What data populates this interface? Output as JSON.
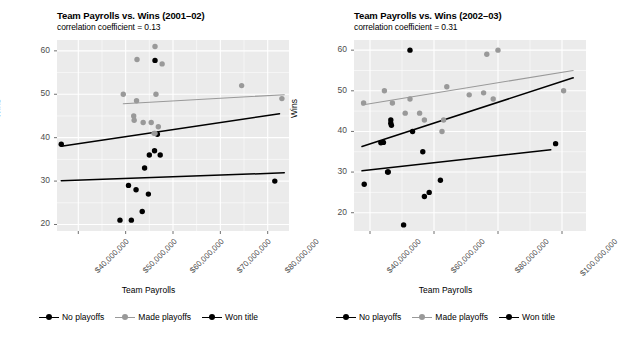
{
  "figure": {
    "background": "#ffffff",
    "panel_background": "#ebebeb",
    "grid_color": "#ffffff",
    "axis_text_color": "#4d4d4d"
  },
  "legend": {
    "items": [
      {
        "label": "No playoffs",
        "color": "#000000",
        "key": "point-line-key"
      },
      {
        "label": "Made playoffs",
        "color": "#999999",
        "key": "point-line-key"
      },
      {
        "label": "Won title",
        "color": "#000000",
        "key": "point-line-key"
      }
    ]
  },
  "chart_data": [
    {
      "type": "scatter",
      "panel": "left",
      "title": "Team Payrolls vs. Wins (2001–02)",
      "subtitle": "correlation coefficient = 0.13",
      "xlabel": "Team Payrolls",
      "ylabel": "Wins",
      "xlim": [
        35500000,
        84500000
      ],
      "ylim": [
        18.5,
        62.5
      ],
      "xticks": [
        40000000,
        50000000,
        60000000,
        70000000,
        80000000
      ],
      "xticklabels": [
        "$40,000,000",
        "$50,000,000",
        "$60,000,000",
        "$70,000,000",
        "$80,000,000"
      ],
      "yticks": [
        20,
        30,
        40,
        50,
        60
      ],
      "yticklabels": [
        "20",
        "30",
        "40",
        "50",
        "60"
      ],
      "grid": true,
      "legend_position": "bottom",
      "series": [
        {
          "name": "No playoffs",
          "color": "#000000",
          "points": [
            {
              "x": 36400000,
              "y": 38.5
            },
            {
              "x": 56700000,
              "y": 40.8
            },
            {
              "x": 55000000,
              "y": 36.0
            },
            {
              "x": 56100000,
              "y": 37.0
            },
            {
              "x": 57300000,
              "y": 36.0
            },
            {
              "x": 54000000,
              "y": 33.0
            },
            {
              "x": 81500000,
              "y": 30.0
            },
            {
              "x": 50600000,
              "y": 29.0
            },
            {
              "x": 52200000,
              "y": 28.0
            },
            {
              "x": 54800000,
              "y": 27.0
            },
            {
              "x": 53500000,
              "y": 23.0
            },
            {
              "x": 48800000,
              "y": 21.0
            },
            {
              "x": 51200000,
              "y": 21.0
            }
          ],
          "fit_line": {
            "x0": 36400000,
            "y0": 38.0,
            "x1": 82500000,
            "y1": 45.5
          }
        },
        {
          "name": "Made playoffs",
          "color": "#999999",
          "points": [
            {
              "x": 56200000,
              "y": 61.0
            },
            {
              "x": 52400000,
              "y": 58.0
            },
            {
              "x": 57700000,
              "y": 57.0
            },
            {
              "x": 74500000,
              "y": 52.0
            },
            {
              "x": 49500000,
              "y": 50.0
            },
            {
              "x": 56400000,
              "y": 50.0
            },
            {
              "x": 83000000,
              "y": 49.0
            },
            {
              "x": 52300000,
              "y": 48.5
            },
            {
              "x": 51700000,
              "y": 45.0
            },
            {
              "x": 51800000,
              "y": 44.0
            },
            {
              "x": 53700000,
              "y": 43.5
            },
            {
              "x": 55400000,
              "y": 43.5
            },
            {
              "x": 56900000,
              "y": 42.5
            },
            {
              "x": 56000000,
              "y": 41.0
            },
            {
              "x": 56200000,
              "y": 41.0
            }
          ],
          "fit_line": {
            "x0": 49500000,
            "y0": 47.8,
            "x1": 83500000,
            "y1": 49.9
          }
        },
        {
          "name": "Won title",
          "color": "#000000",
          "points": [
            {
              "x": 56200000,
              "y": 57.8
            }
          ],
          "fit_line": {
            "x0": 36400000,
            "y0": 30.1,
            "x1": 83500000,
            "y1": 31.9
          }
        }
      ]
    },
    {
      "type": "scatter",
      "panel": "right",
      "title": "Team Payrolls vs. Wins (2002–03)",
      "subtitle": "correlation coefficient = 0.31",
      "xlabel": "Team Payrolls",
      "ylabel": "Wins",
      "xlim": [
        35000000,
        107500000
      ],
      "ylim": [
        15.5,
        62.5
      ],
      "xticks": [
        40000000,
        60000000,
        80000000,
        100000000
      ],
      "xticklabels": [
        "$40,000,000",
        "$60,000,000",
        "$80,000,000",
        "$100,000,000"
      ],
      "yticks": [
        20,
        30,
        40,
        50,
        60
      ],
      "yticklabels": [
        "20",
        "30",
        "40",
        "50",
        "60"
      ],
      "grid": true,
      "legend_position": "bottom",
      "series": [
        {
          "name": "No playoffs",
          "color": "#000000",
          "points": [
            {
              "x": 52500000,
              "y": 60.0
            },
            {
              "x": 98000000,
              "y": 37.0
            },
            {
              "x": 46500000,
              "y": 42.8
            },
            {
              "x": 46500000,
              "y": 42.0
            },
            {
              "x": 46700000,
              "y": 41.5
            },
            {
              "x": 53300000,
              "y": 40.0
            },
            {
              "x": 44200000,
              "y": 37.3
            },
            {
              "x": 43400000,
              "y": 37.2
            },
            {
              "x": 56500000,
              "y": 35.0
            },
            {
              "x": 45500000,
              "y": 30.0
            },
            {
              "x": 38200000,
              "y": 27.0
            },
            {
              "x": 62000000,
              "y": 28.0
            },
            {
              "x": 58500000,
              "y": 25.0
            },
            {
              "x": 57000000,
              "y": 24.0
            },
            {
              "x": 50500000,
              "y": 17.0
            }
          ],
          "fit_line": {
            "x0": 37500000,
            "y0": 36.3,
            "x1": 103500000,
            "y1": 53.2
          }
        },
        {
          "name": "Made playoffs",
          "color": "#999999",
          "points": [
            {
              "x": 76500000,
              "y": 59.0
            },
            {
              "x": 80000000,
              "y": 60.0
            },
            {
              "x": 44500000,
              "y": 50.0
            },
            {
              "x": 64000000,
              "y": 51.0
            },
            {
              "x": 71000000,
              "y": 49.0
            },
            {
              "x": 75500000,
              "y": 49.5
            },
            {
              "x": 100500000,
              "y": 50.0
            },
            {
              "x": 38000000,
              "y": 47.0
            },
            {
              "x": 47000000,
              "y": 47.0
            },
            {
              "x": 52500000,
              "y": 48.0
            },
            {
              "x": 78500000,
              "y": 48.0
            },
            {
              "x": 51000000,
              "y": 44.5
            },
            {
              "x": 55500000,
              "y": 44.5
            },
            {
              "x": 57000000,
              "y": 42.8
            },
            {
              "x": 63000000,
              "y": 42.8
            },
            {
              "x": 62500000,
              "y": 40.0
            }
          ],
          "fit_line": {
            "x0": 37500000,
            "y0": 46.5,
            "x1": 103500000,
            "y1": 55.0
          }
        },
        {
          "name": "Won title",
          "color": "#000000",
          "points": [
            {
              "x": 45700000,
              "y": 30.0
            }
          ],
          "fit_line": {
            "x0": 37500000,
            "y0": 30.3,
            "x1": 96500000,
            "y1": 35.5
          }
        }
      ]
    }
  ]
}
